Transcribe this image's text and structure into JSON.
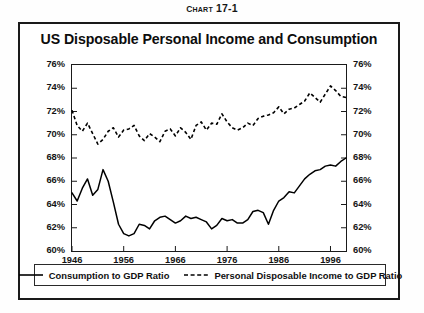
{
  "figure_number": {
    "prefix": "C",
    "rest": "HART",
    "number": " 17-1",
    "full": "Chart 17-1"
  },
  "chart_data": {
    "type": "line",
    "title": "US Disposable Personal Income and Consumption",
    "xlabel": "",
    "ylabel": "",
    "xlim": [
      1946,
      1999
    ],
    "ylim": [
      60,
      76
    ],
    "grid": false,
    "legend_position": "bottom",
    "y_ticks": [
      "60%",
      "62%",
      "64%",
      "66%",
      "68%",
      "70%",
      "72%",
      "74%",
      "76%"
    ],
    "y_tick_values": [
      60,
      62,
      64,
      66,
      68,
      70,
      72,
      74,
      76
    ],
    "x_ticks": [
      "1946",
      "1956",
      "1966",
      "1976",
      "1986",
      "1996"
    ],
    "x_tick_values": [
      1946,
      1956,
      1966,
      1976,
      1986,
      1996
    ],
    "dual_axis": true,
    "x": [
      1946,
      1947,
      1948,
      1949,
      1950,
      1951,
      1952,
      1953,
      1954,
      1955,
      1956,
      1957,
      1958,
      1959,
      1960,
      1961,
      1962,
      1963,
      1964,
      1965,
      1966,
      1967,
      1968,
      1969,
      1970,
      1971,
      1972,
      1973,
      1974,
      1975,
      1976,
      1977,
      1978,
      1979,
      1980,
      1981,
      1982,
      1983,
      1984,
      1985,
      1986,
      1987,
      1988,
      1989,
      1990,
      1991,
      1992,
      1993,
      1994,
      1995,
      1996,
      1997,
      1998,
      1999
    ],
    "series": [
      {
        "name": "Consumption to GDP Ratio",
        "style": "solid",
        "color": "#000000",
        "values": [
          65.0,
          64.3,
          65.4,
          66.2,
          64.8,
          65.3,
          67.0,
          66.0,
          64.2,
          62.3,
          61.5,
          61.3,
          61.5,
          62.3,
          62.2,
          61.9,
          62.6,
          62.9,
          63.0,
          62.7,
          62.4,
          62.6,
          63.0,
          62.8,
          62.9,
          62.7,
          62.5,
          61.9,
          62.2,
          62.8,
          62.6,
          62.7,
          62.4,
          62.4,
          62.7,
          63.4,
          63.5,
          63.3,
          62.3,
          63.5,
          64.3,
          64.6,
          65.1,
          65.0,
          65.6,
          66.2,
          66.6,
          66.9,
          67.0,
          67.3,
          67.4,
          67.3,
          67.7,
          68.0
        ]
      },
      {
        "name": "Personal Disposable Income to GDP Ratio",
        "style": "dashed",
        "color": "#000000",
        "values": [
          72.1,
          70.8,
          70.3,
          71.0,
          70.1,
          69.2,
          69.6,
          70.3,
          70.6,
          69.8,
          70.4,
          70.5,
          70.8,
          69.9,
          69.5,
          70.1,
          69.8,
          69.4,
          70.3,
          70.5,
          69.9,
          70.6,
          70.2,
          69.6,
          70.8,
          71.1,
          70.4,
          71.0,
          70.9,
          71.8,
          71.1,
          70.6,
          70.4,
          70.6,
          71.0,
          70.8,
          71.4,
          71.6,
          71.7,
          71.9,
          72.4,
          71.8,
          72.2,
          72.3,
          72.6,
          72.9,
          73.6,
          73.2,
          72.8,
          73.5,
          74.2,
          73.8,
          73.3,
          73.2
        ]
      }
    ]
  },
  "legend": {
    "items": [
      {
        "label": "Consumption to GDP Ratio",
        "style": "solid"
      },
      {
        "label": "Personal Disposable Income to GDP Ratio",
        "style": "dashed"
      }
    ]
  }
}
